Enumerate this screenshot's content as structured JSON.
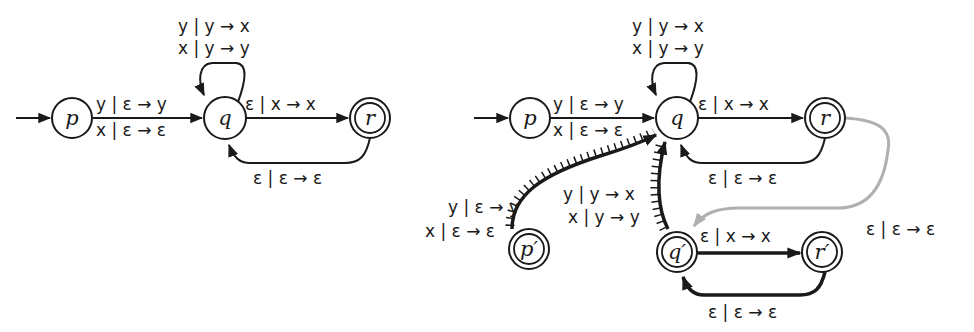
{
  "left_automaton": {
    "states": {
      "p": {
        "label": "p",
        "accepting": false,
        "initial": true
      },
      "q": {
        "label": "q",
        "accepting": false
      },
      "r": {
        "label": "r",
        "accepting": true
      }
    },
    "transitions": {
      "p_q": {
        "line1": "y | ε → y",
        "line2": "x | ε → ε"
      },
      "q_loop": {
        "line1": "y | y → x",
        "line2": "x | y → y"
      },
      "q_r": {
        "line1": "ε | x → x"
      },
      "r_q": {
        "line1": "ε | ε → ε"
      }
    }
  },
  "right_automaton": {
    "states": {
      "p": {
        "label": "p",
        "accepting": false,
        "initial": true
      },
      "q": {
        "label": "q",
        "accepting": false
      },
      "r": {
        "label": "r",
        "accepting": true
      },
      "p_prime": {
        "label": "p′",
        "accepting": true
      },
      "q_prime": {
        "label": "q′",
        "accepting": true
      },
      "r_prime": {
        "label": "r′",
        "accepting": true
      }
    },
    "transitions": {
      "p_q": {
        "line1": "y | ε → y",
        "line2": "x | ε → ε"
      },
      "q_loop": {
        "line1": "y | y → x",
        "line2": "x | y → y"
      },
      "q_r": {
        "line1": "ε | x → x"
      },
      "r_q": {
        "line1": "ε | ε → ε"
      },
      "pprime_q": {
        "line1": "y | ε → y",
        "line2": "x | ε → ε",
        "style": "reversed-hatched"
      },
      "qprime_q": {
        "line1": "y | y → x",
        "line2": "x | y → y",
        "style": "reversed-hatched"
      },
      "r_qprime": {
        "line1": "ε | ε → ε",
        "color": "#b0b0b0"
      },
      "qprime_rprime": {
        "line1": "ε | x → x",
        "style": "bold"
      },
      "rprime_qprime": {
        "line1": "ε | ε → ε",
        "style": "bold"
      }
    }
  }
}
